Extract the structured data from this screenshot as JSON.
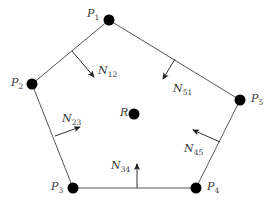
{
  "diagram": {
    "title": "",
    "colors": {
      "edge": "#555555",
      "vertex": "#000000",
      "arrow": "#333333",
      "text": "#3a3a3a"
    },
    "vertices": [
      {
        "id": "P1",
        "letter": "P",
        "sub": "1",
        "x": 109,
        "y": 20,
        "label_x": 87,
        "label_y": 8
      },
      {
        "id": "P2",
        "letter": "P",
        "sub": "2",
        "x": 32,
        "y": 84,
        "label_x": 11,
        "label_y": 77
      },
      {
        "id": "P3",
        "letter": "P",
        "sub": "3",
        "x": 73,
        "y": 188,
        "label_x": 51,
        "label_y": 181
      },
      {
        "id": "P4",
        "letter": "P",
        "sub": "4",
        "x": 196,
        "y": 188,
        "label_x": 207,
        "label_y": 181
      },
      {
        "id": "P5",
        "letter": "P",
        "sub": "5",
        "x": 240,
        "y": 100,
        "label_x": 251,
        "label_y": 93
      }
    ],
    "reference_point": {
      "id": "R",
      "letter": "R",
      "x": 134,
      "y": 114,
      "label_x": 120,
      "label_y": 107
    },
    "edges": [
      [
        "P1",
        "P2"
      ],
      [
        "P2",
        "P3"
      ],
      [
        "P3",
        "P4"
      ],
      [
        "P4",
        "P5"
      ],
      [
        "P5",
        "P1"
      ]
    ],
    "normals": [
      {
        "id": "N12",
        "letter": "N",
        "sub": "12",
        "x1": 72,
        "y1": 51,
        "x2": 94,
        "y2": 77,
        "label_x": 98,
        "label_y": 65
      },
      {
        "id": "N23",
        "letter": "N",
        "sub": "23",
        "x1": 55,
        "y1": 136,
        "x2": 80,
        "y2": 127,
        "label_x": 62,
        "label_y": 113
      },
      {
        "id": "N34",
        "letter": "N",
        "sub": "34",
        "x1": 137,
        "y1": 188,
        "x2": 137,
        "y2": 164,
        "label_x": 111,
        "label_y": 160
      },
      {
        "id": "N45",
        "letter": "N",
        "sub": "45",
        "x1": 220,
        "y1": 142,
        "x2": 193,
        "y2": 130,
        "label_x": 184,
        "label_y": 143
      },
      {
        "id": "N51",
        "letter": "N",
        "sub": "51",
        "x1": 175,
        "y1": 59,
        "x2": 163,
        "y2": 79,
        "label_x": 173,
        "label_y": 83
      }
    ]
  }
}
